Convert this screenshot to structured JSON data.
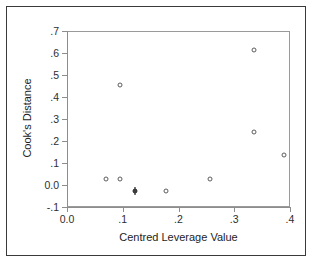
{
  "chart_data": {
    "type": "scatter",
    "title": "",
    "xlabel": "Centred Leverage Value",
    "ylabel": "Cook's Distance",
    "xlim": [
      0.0,
      0.4
    ],
    "ylim": [
      -0.1,
      0.7
    ],
    "grid": false,
    "legend": "none",
    "marker": "open-circle",
    "xticks": [
      "0.0",
      ".1",
      ".2",
      ".3",
      ".4"
    ],
    "xtick_values": [
      0.0,
      0.1,
      0.2,
      0.3,
      0.4
    ],
    "yticks": [
      "-.1",
      "0.0",
      ".1",
      ".2",
      ".3",
      ".4",
      ".5",
      ".6",
      ".7"
    ],
    "ytick_values": [
      -0.1,
      0.0,
      0.1,
      0.2,
      0.3,
      0.4,
      0.5,
      0.6,
      0.7
    ],
    "points": [
      {
        "x": 0.068,
        "y": 0.034,
        "overlap": false
      },
      {
        "x": 0.094,
        "y": 0.034,
        "overlap": false
      },
      {
        "x": 0.093,
        "y": 0.459,
        "overlap": false
      },
      {
        "x": 0.121,
        "y": -0.023,
        "overlap": true
      },
      {
        "x": 0.176,
        "y": -0.021,
        "overlap": false
      },
      {
        "x": 0.254,
        "y": 0.033,
        "overlap": false
      },
      {
        "x": 0.333,
        "y": 0.62,
        "overlap": false
      },
      {
        "x": 0.334,
        "y": 0.247,
        "overlap": false
      },
      {
        "x": 0.388,
        "y": 0.139,
        "overlap": false
      }
    ]
  },
  "style": {
    "panel_background": "#ffffff",
    "frame_color": "#9a9a9a",
    "outer_border_color": "#3a3a3a",
    "marker_edge_color": "#5c5c5c",
    "text_color": "#1d1d1d"
  }
}
